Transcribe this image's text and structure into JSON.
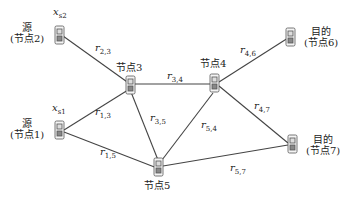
{
  "diagram": {
    "line_color": "#444444",
    "nodes": [
      {
        "id": "node2",
        "title": "源",
        "subtitle": "(节点2)",
        "signal": "x",
        "signal_sub": "s2",
        "x": 60,
        "y": 36
      },
      {
        "id": "node1",
        "title": "源",
        "subtitle": "(节点1)",
        "signal": "x",
        "signal_sub": "s1",
        "x": 60,
        "y": 131
      },
      {
        "id": "node3",
        "title": "节点3",
        "x": 130,
        "y": 87
      },
      {
        "id": "node4",
        "title": "节点4",
        "x": 214,
        "y": 77
      },
      {
        "id": "node5",
        "title": "节点5",
        "x": 159,
        "y": 167
      },
      {
        "id": "node6",
        "title": "目的",
        "subtitle": "(节点6)",
        "x": 290,
        "y": 42
      },
      {
        "id": "node7",
        "title": "目的",
        "subtitle": "(节点7)",
        "x": 292,
        "y": 145
      }
    ],
    "edges": [
      {
        "from": "node2",
        "to": "node3",
        "label": "r",
        "sub": "2,3"
      },
      {
        "from": "node1",
        "to": "node3",
        "label": "r",
        "sub": "1,3"
      },
      {
        "from": "node1",
        "to": "node5",
        "label": "r",
        "sub": "1,5"
      },
      {
        "from": "node3",
        "to": "node4",
        "label": "r",
        "sub": "3,4"
      },
      {
        "from": "node3",
        "to": "node5",
        "label": "r",
        "sub": "3,5"
      },
      {
        "from": "node5",
        "to": "node4",
        "label": "r",
        "sub": "5,4"
      },
      {
        "from": "node4",
        "to": "node6",
        "label": "r",
        "sub": "4,6"
      },
      {
        "from": "node4",
        "to": "node7",
        "label": "r",
        "sub": "4,7"
      },
      {
        "from": "node5",
        "to": "node7",
        "label": "r",
        "sub": "5,7"
      }
    ]
  }
}
